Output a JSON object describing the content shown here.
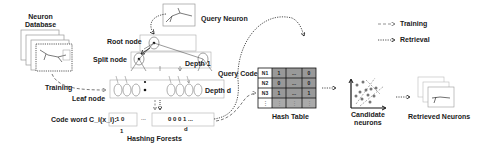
{
  "diagram": {
    "neuron_database": {
      "line1": "Neuron",
      "line2": "Database"
    },
    "query_neuron": "Query Neuron",
    "root_node": "Root node",
    "split_node": "Split node",
    "depth_1": "Depth 1",
    "depth_d": "Depth d",
    "leaf_node": "Leaf node",
    "training_label": "Training",
    "code_word": "Code word C_i(x_i):",
    "code_box_1": "1 0",
    "code_ellipsis": "...",
    "code_box_d": "0 0 0 1 ...",
    "index_1": "1",
    "index_d": "d",
    "hashing_forests": "Hashing Forests",
    "query_code": "Query Code",
    "hash_table": {
      "title": "Hash Table",
      "rows": [
        [
          "N1",
          "1",
          "...",
          "0"
        ],
        [
          "N2",
          "0",
          "...",
          "0"
        ],
        [
          "N3",
          "1",
          "...",
          "1"
        ],
        [
          "⋮",
          "⋮",
          "⋮",
          "⋮"
        ]
      ]
    },
    "candidate_neurons": {
      "line1": "Candidate",
      "line2": "neurons"
    },
    "retrieved_neurons": "Retrieved Neurons",
    "legend": {
      "training": "Training",
      "retrieval": "Retrieval"
    }
  }
}
